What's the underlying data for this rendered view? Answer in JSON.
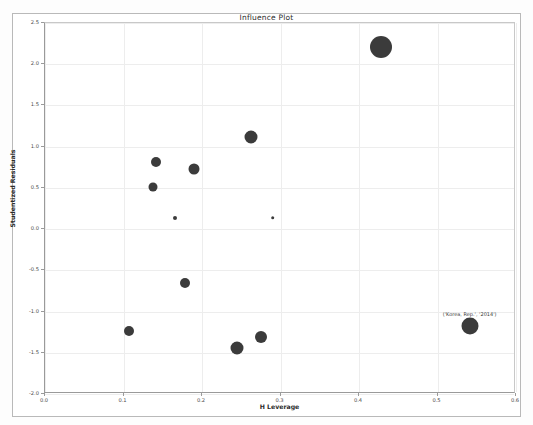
{
  "figure": {
    "title": "Influence Plot",
    "background_color": "#ffffff",
    "frame_color": "#b9b9b9",
    "point_color": "#3b3b3b"
  },
  "chart_data": {
    "type": "scatter",
    "title": "Influence Plot",
    "xlabel": "H Leverage",
    "ylabel": "Studentized Residuals",
    "xlim": [
      0.0,
      0.6
    ],
    "ylim": [
      -2.0,
      2.5
    ],
    "xticks": [
      0.0,
      0.1,
      0.2,
      0.3,
      0.4,
      0.5,
      0.6
    ],
    "xticklabels": [
      "0.0",
      "0.1",
      "0.2",
      "0.3",
      "0.4",
      "0.5",
      "0.6"
    ],
    "yticks": [
      -2.0,
      -1.5,
      -1.0,
      -0.5,
      0.0,
      0.5,
      1.0,
      1.5,
      2.0,
      2.5
    ],
    "yticklabels": [
      "-2.0",
      "-1.5",
      "-1.0",
      "-0.5",
      "0.0",
      "0.5",
      "1.0",
      "1.5",
      "2.0",
      "2.5"
    ],
    "grid": true,
    "legend": null,
    "points": [
      {
        "x": 0.428,
        "y": 2.21,
        "size": 11.0,
        "label": null
      },
      {
        "x": 0.262,
        "y": 1.12,
        "size": 6.5,
        "label": null
      },
      {
        "x": 0.19,
        "y": 0.73,
        "size": 5.5,
        "label": null
      },
      {
        "x": 0.141,
        "y": 0.81,
        "size": 5.0,
        "label": null
      },
      {
        "x": 0.138,
        "y": 0.51,
        "size": 4.5,
        "label": null
      },
      {
        "x": 0.166,
        "y": 0.14,
        "size": 2.0,
        "label": null
      },
      {
        "x": 0.29,
        "y": 0.14,
        "size": 1.8,
        "label": null
      },
      {
        "x": 0.178,
        "y": -0.65,
        "size": 5.0,
        "label": null
      },
      {
        "x": 0.107,
        "y": -1.23,
        "size": 5.0,
        "label": null
      },
      {
        "x": 0.275,
        "y": -1.31,
        "size": 6.0,
        "label": null
      },
      {
        "x": 0.245,
        "y": -1.44,
        "size": 6.5,
        "label": null
      },
      {
        "x": 0.541,
        "y": -1.18,
        "size": 8.5,
        "label": "('Korea, Rep.', '2014')"
      }
    ],
    "annotations": [
      {
        "text": "('Korea, Rep.', '2014')",
        "x": 0.541,
        "y": -1.06
      }
    ]
  }
}
